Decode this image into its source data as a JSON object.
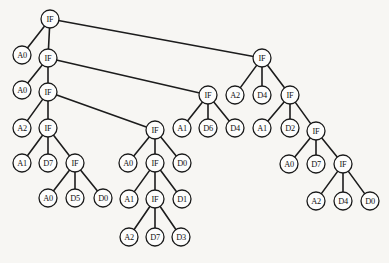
{
  "figure": {
    "background_color": "#f7f6f3",
    "node_fill": "#fdfdfc",
    "node_stroke": "#1a1a1a",
    "edge_color": "#1c1c1c",
    "node_radius": 9
  },
  "chart_data": {
    "type": "diagram",
    "subtype": "node-link-tree",
    "title": "",
    "xlabel": "",
    "ylabel": "",
    "layout": "top-down decision tree with right-leaning spine",
    "node_count": 42,
    "edge_count": 41,
    "labels_used": [
      "IF",
      "A0",
      "A1",
      "A2",
      "D0",
      "D1",
      "D2",
      "D3",
      "D4",
      "D5",
      "D6",
      "D7"
    ],
    "nodes": [
      {
        "id": "n0",
        "label": "IF",
        "x": 50,
        "y": 19
      },
      {
        "id": "n1",
        "label": "A0",
        "x": 22,
        "y": 55
      },
      {
        "id": "n2",
        "label": "IF",
        "x": 48,
        "y": 58
      },
      {
        "id": "n3",
        "label": "IF",
        "x": 262,
        "y": 58
      },
      {
        "id": "n4",
        "label": "A0",
        "x": 22,
        "y": 90
      },
      {
        "id": "n5",
        "label": "IF",
        "x": 48,
        "y": 92
      },
      {
        "id": "n6",
        "label": "IF",
        "x": 208,
        "y": 95
      },
      {
        "id": "n7",
        "label": "A2",
        "x": 235,
        "y": 95
      },
      {
        "id": "n8",
        "label": "D4",
        "x": 262,
        "y": 95
      },
      {
        "id": "n9",
        "label": "IF",
        "x": 290,
        "y": 95
      },
      {
        "id": "n10",
        "label": "A2",
        "x": 22,
        "y": 128
      },
      {
        "id": "n11",
        "label": "IF",
        "x": 48,
        "y": 128
      },
      {
        "id": "n12",
        "label": "IF",
        "x": 155,
        "y": 130
      },
      {
        "id": "n13",
        "label": "A1",
        "x": 182,
        "y": 128
      },
      {
        "id": "n14",
        "label": "D6",
        "x": 208,
        "y": 128
      },
      {
        "id": "n15",
        "label": "D4",
        "x": 235,
        "y": 128
      },
      {
        "id": "n16",
        "label": "A1",
        "x": 262,
        "y": 128
      },
      {
        "id": "n17",
        "label": "D2",
        "x": 290,
        "y": 128
      },
      {
        "id": "n18",
        "label": "IF",
        "x": 316,
        "y": 131
      },
      {
        "id": "n19",
        "label": "A1",
        "x": 22,
        "y": 163
      },
      {
        "id": "n20",
        "label": "D7",
        "x": 48,
        "y": 163
      },
      {
        "id": "n21",
        "label": "IF",
        "x": 75,
        "y": 163
      },
      {
        "id": "n22",
        "label": "A0",
        "x": 128,
        "y": 163
      },
      {
        "id": "n23",
        "label": "IF",
        "x": 155,
        "y": 163
      },
      {
        "id": "n24",
        "label": "D0",
        "x": 182,
        "y": 163
      },
      {
        "id": "n25",
        "label": "A0",
        "x": 289,
        "y": 164
      },
      {
        "id": "n26",
        "label": "D7",
        "x": 316,
        "y": 164
      },
      {
        "id": "n27",
        "label": "IF",
        "x": 343,
        "y": 164
      },
      {
        "id": "n28",
        "label": "A0",
        "x": 48,
        "y": 198
      },
      {
        "id": "n29",
        "label": "D5",
        "x": 75,
        "y": 198
      },
      {
        "id": "n30",
        "label": "D0",
        "x": 103,
        "y": 198
      },
      {
        "id": "n31",
        "label": "A1",
        "x": 129,
        "y": 199
      },
      {
        "id": "n32",
        "label": "IF",
        "x": 155,
        "y": 199
      },
      {
        "id": "n33",
        "label": "D1",
        "x": 182,
        "y": 199
      },
      {
        "id": "n34",
        "label": "A2",
        "x": 316,
        "y": 201
      },
      {
        "id": "n35",
        "label": "D4",
        "x": 343,
        "y": 201
      },
      {
        "id": "n36",
        "label": "D0",
        "x": 370,
        "y": 201
      },
      {
        "id": "n37",
        "label": "A2",
        "x": 129,
        "y": 237
      },
      {
        "id": "n38",
        "label": "D7",
        "x": 155,
        "y": 237
      },
      {
        "id": "n39",
        "label": "D3",
        "x": 181,
        "y": 237
      }
    ],
    "edges": [
      {
        "from": "n0",
        "to": "n1"
      },
      {
        "from": "n0",
        "to": "n2"
      },
      {
        "from": "n0",
        "to": "n3"
      },
      {
        "from": "n2",
        "to": "n4"
      },
      {
        "from": "n2",
        "to": "n5"
      },
      {
        "from": "n2",
        "to": "n6"
      },
      {
        "from": "n5",
        "to": "n10"
      },
      {
        "from": "n5",
        "to": "n11"
      },
      {
        "from": "n5",
        "to": "n12"
      },
      {
        "from": "n3",
        "to": "n7"
      },
      {
        "from": "n3",
        "to": "n8"
      },
      {
        "from": "n3",
        "to": "n9"
      },
      {
        "from": "n6",
        "to": "n13"
      },
      {
        "from": "n6",
        "to": "n14"
      },
      {
        "from": "n6",
        "to": "n15"
      },
      {
        "from": "n9",
        "to": "n16"
      },
      {
        "from": "n9",
        "to": "n17"
      },
      {
        "from": "n9",
        "to": "n18"
      },
      {
        "from": "n11",
        "to": "n19"
      },
      {
        "from": "n11",
        "to": "n20"
      },
      {
        "from": "n11",
        "to": "n21"
      },
      {
        "from": "n12",
        "to": "n22"
      },
      {
        "from": "n12",
        "to": "n23"
      },
      {
        "from": "n12",
        "to": "n24"
      },
      {
        "from": "n18",
        "to": "n25"
      },
      {
        "from": "n18",
        "to": "n26"
      },
      {
        "from": "n18",
        "to": "n27"
      },
      {
        "from": "n21",
        "to": "n28"
      },
      {
        "from": "n21",
        "to": "n29"
      },
      {
        "from": "n21",
        "to": "n30"
      },
      {
        "from": "n23",
        "to": "n31"
      },
      {
        "from": "n23",
        "to": "n32"
      },
      {
        "from": "n23",
        "to": "n33"
      },
      {
        "from": "n27",
        "to": "n34"
      },
      {
        "from": "n27",
        "to": "n35"
      },
      {
        "from": "n27",
        "to": "n36"
      },
      {
        "from": "n32",
        "to": "n37"
      },
      {
        "from": "n32",
        "to": "n38"
      },
      {
        "from": "n32",
        "to": "n39"
      }
    ]
  }
}
